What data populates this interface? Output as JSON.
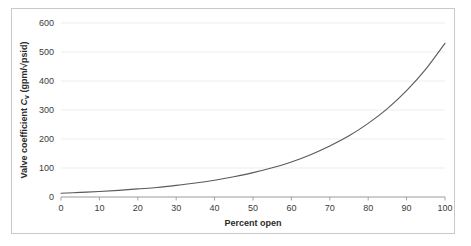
{
  "figure": {
    "border_color": "#c9c9c9",
    "background": "#ffffff"
  },
  "chart_data": {
    "type": "line",
    "title": "",
    "xlabel": "Percent open",
    "ylabel_plain": "Valve coefficient Cv (gpm/√psid)",
    "ylabel_prefix": "Valve coefficient ",
    "ylabel_symbol": "C",
    "ylabel_subscript": "v",
    "ylabel_units": " (gpm/√psid)",
    "xlim": [
      0,
      100
    ],
    "ylim": [
      0,
      600
    ],
    "xticks": [
      0,
      10,
      20,
      30,
      40,
      50,
      60,
      70,
      80,
      90,
      100
    ],
    "yticks": [
      0,
      100,
      200,
      300,
      400,
      500,
      600
    ],
    "grid": "horizontal",
    "legend": "none",
    "series": [
      {
        "name": "Equal-percentage valve characteristic",
        "color": "#595959",
        "x": [
          0,
          5,
          10,
          15,
          20,
          25,
          30,
          35,
          40,
          45,
          50,
          55,
          60,
          65,
          70,
          75,
          80,
          85,
          90,
          95,
          100
        ],
        "values": [
          13,
          16,
          19,
          23,
          28,
          33,
          40,
          48,
          58,
          70,
          84,
          101,
          121,
          146,
          176,
          211,
          254,
          305,
          367,
          441,
          530
        ]
      }
    ]
  }
}
